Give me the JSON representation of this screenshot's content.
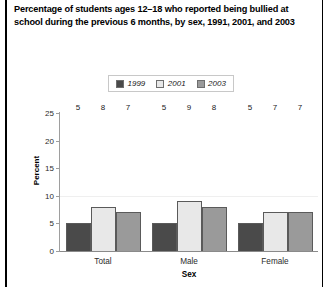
{
  "frame": {
    "left_rule": "vertical-black-rule",
    "right_rule": "vertical-black-rule"
  },
  "title": "Percentage of students ages 12–18 who reported being bullied at school during the previous 6 months, by sex, 1991, 2001, and 2003",
  "legend": {
    "position": "top-center",
    "items": [
      {
        "label": "1999",
        "color": "#4a4a4a"
      },
      {
        "label": "2001",
        "color": "#e8e8e8"
      },
      {
        "label": "2003",
        "color": "#9a9a9a"
      }
    ]
  },
  "axes": {
    "y": {
      "label": "Percent",
      "ticks": [
        "0",
        "5",
        "10",
        "15",
        "20",
        "25"
      ],
      "min": 0,
      "max": 25
    },
    "x": {
      "label": "Sex",
      "ticks": [
        "Total",
        "Male",
        "Female"
      ]
    }
  },
  "chart_data": {
    "type": "bar",
    "title": "Percentage of students ages 12–18 who reported being bullied at school during the previous 6 months, by sex, 1991, 2001, and 2003",
    "xlabel": "Sex",
    "ylabel": "Percent",
    "ylim": [
      0,
      25
    ],
    "ytick_values": [
      0,
      5,
      10,
      15,
      20,
      25
    ],
    "grid": "horizontal-faint",
    "legend_position": "top-center",
    "categories": [
      "Total",
      "Male",
      "Female"
    ],
    "series": [
      {
        "name": "1999",
        "color": "#4a4a4a",
        "values": [
          5,
          5,
          5
        ]
      },
      {
        "name": "2001",
        "color": "#e8e8e8",
        "values": [
          8,
          9,
          7
        ]
      },
      {
        "name": "2003",
        "color": "#9a9a9a",
        "values": [
          7,
          8,
          7
        ]
      }
    ],
    "data_labels": [
      [
        "5",
        "8",
        "7"
      ],
      [
        "5",
        "9",
        "8"
      ],
      [
        "5",
        "7",
        "7"
      ]
    ]
  }
}
